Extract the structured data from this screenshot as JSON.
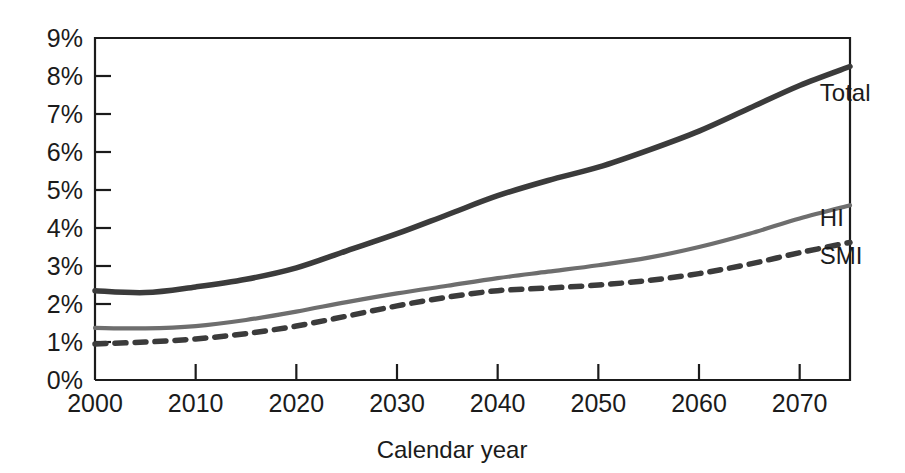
{
  "chart_data": {
    "type": "line",
    "title": "",
    "xlabel": "Calendar year",
    "ylabel": "",
    "xlim": [
      2000,
      2075
    ],
    "ylim": [
      0,
      9
    ],
    "grid": false,
    "legend_position": "right-inline",
    "x_ticks": [
      "2000",
      "2010",
      "2020",
      "2030",
      "2040",
      "2050",
      "2060",
      "2070"
    ],
    "x_tick_values": [
      2000,
      2010,
      2020,
      2030,
      2040,
      2050,
      2060,
      2070
    ],
    "y_ticks": [
      "0%",
      "1%",
      "2%",
      "3%",
      "4%",
      "5%",
      "6%",
      "7%",
      "8%",
      "9%"
    ],
    "y_tick_values": [
      0,
      1,
      2,
      3,
      4,
      5,
      6,
      7,
      8,
      9
    ],
    "x": [
      2000,
      2005,
      2010,
      2015,
      2020,
      2025,
      2030,
      2035,
      2040,
      2045,
      2050,
      2055,
      2060,
      2065,
      2070,
      2075
    ],
    "series": [
      {
        "name": "Total",
        "label": "Total",
        "color": "#3b3b3b",
        "style": "solid",
        "width": 5.5,
        "values": [
          2.35,
          2.3,
          2.45,
          2.65,
          2.95,
          3.4,
          3.85,
          4.35,
          4.85,
          5.25,
          5.6,
          6.05,
          6.55,
          7.15,
          7.75,
          8.25
        ]
      },
      {
        "name": "HI",
        "label": "HI",
        "color": "#6e6e6e",
        "style": "solid",
        "width": 4.2,
        "values": [
          1.37,
          1.36,
          1.42,
          1.58,
          1.8,
          2.05,
          2.28,
          2.48,
          2.68,
          2.85,
          3.02,
          3.22,
          3.5,
          3.85,
          4.25,
          4.6
        ]
      },
      {
        "name": "SMI",
        "label": "SMI",
        "color": "#3b3b3b",
        "style": "dashed",
        "width": 5.5,
        "values": [
          0.95,
          1.0,
          1.08,
          1.22,
          1.42,
          1.68,
          1.95,
          2.18,
          2.35,
          2.42,
          2.5,
          2.62,
          2.8,
          3.05,
          3.35,
          3.62
        ]
      }
    ],
    "series_label_positions": [
      {
        "name": "Total",
        "x": 2072,
        "y": 7.35
      },
      {
        "name": "HI",
        "x": 2072,
        "y": 4.05
      },
      {
        "name": "SMI",
        "x": 2072,
        "y": 3.05
      }
    ]
  }
}
